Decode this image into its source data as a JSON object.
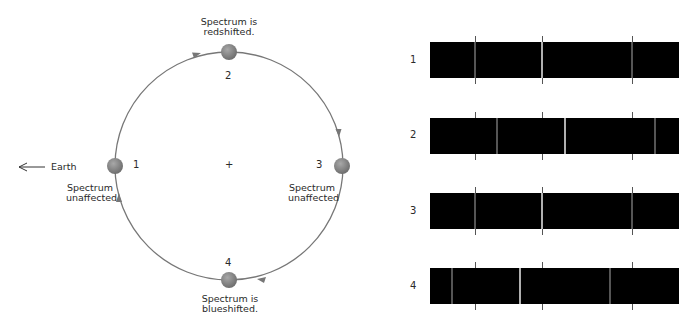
{
  "orbit": {
    "center_marker": "+",
    "earth_label": "Earth",
    "earth_arrow_icon": "left-arrow",
    "colors": {
      "orbit_line": "#777777",
      "star_dot": "#8a8a8a",
      "arrowhead": "#777777"
    },
    "positions": [
      {
        "id": "1",
        "number": "1",
        "caption": [
          "Spectrum",
          "unaffected"
        ]
      },
      {
        "id": "2",
        "number": "2",
        "caption": [
          "Spectrum is",
          "redshifted."
        ]
      },
      {
        "id": "3",
        "number": "3",
        "caption": [
          "Spectrum",
          "unaffected"
        ]
      },
      {
        "id": "4",
        "number": "4",
        "caption": [
          "Spectrum is",
          "blueshifted."
        ]
      }
    ]
  },
  "spectra": {
    "reference_tick_x": [
      475,
      542,
      632
    ],
    "rows": [
      {
        "label": "1",
        "state": "unshifted",
        "lines_x": [
          475,
          542,
          632
        ]
      },
      {
        "label": "2",
        "state": "redshifted",
        "lines_x": [
          497,
          565,
          655
        ]
      },
      {
        "label": "3",
        "state": "unshifted",
        "lines_x": [
          475,
          542,
          632
        ]
      },
      {
        "label": "4",
        "state": "blueshifted",
        "lines_x": [
          452,
          520,
          610
        ]
      }
    ],
    "colors": {
      "bar": "#000000",
      "line": "#9a9a9a",
      "tick": "#555555"
    }
  }
}
